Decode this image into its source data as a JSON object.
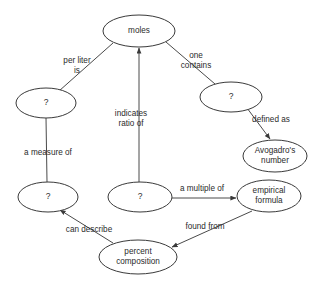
{
  "diagram": {
    "type": "concept-map",
    "background_color": "#ffffff",
    "stroke_color": "#3a3a3a",
    "text_color": "#2b2b2b",
    "nodes": [
      {
        "id": "moles",
        "label": "moles",
        "lines": [
          "moles"
        ],
        "cx": 139,
        "cy": 31,
        "rx": 36,
        "ry": 16
      },
      {
        "id": "q-molarity",
        "label": "?",
        "lines": [
          "?"
        ],
        "cx": 46,
        "cy": 103,
        "rx": 30,
        "ry": 15
      },
      {
        "id": "q-solution",
        "label": "?",
        "lines": [
          "?"
        ],
        "cx": 48,
        "cy": 197,
        "rx": 30,
        "ry": 15
      },
      {
        "id": "q-formula",
        "label": "?",
        "lines": [
          "?"
        ],
        "cx": 140,
        "cy": 197,
        "rx": 32,
        "ry": 15
      },
      {
        "id": "q-particles",
        "label": "?",
        "lines": [
          "?"
        ],
        "cx": 231,
        "cy": 97,
        "rx": 31,
        "ry": 15
      },
      {
        "id": "avogadro",
        "label": "Avogadro's number",
        "lines": [
          "Avogadro's",
          "number"
        ],
        "cx": 275,
        "cy": 156,
        "rx": 32,
        "ry": 16
      },
      {
        "id": "empirical",
        "label": "empirical formula",
        "lines": [
          "empirical",
          "formula"
        ],
        "cx": 269,
        "cy": 196,
        "rx": 32,
        "ry": 16
      },
      {
        "id": "percent",
        "label": "percent composition",
        "lines": [
          "percent",
          "composition"
        ],
        "cx": 138,
        "cy": 257,
        "rx": 39,
        "ry": 17
      }
    ],
    "edges": [
      {
        "id": "e-moles-molarity",
        "from": "moles",
        "to": "q-molarity",
        "label_lines": [
          "per liter",
          "is"
        ],
        "label_x": 77,
        "label_y": 66,
        "arrow": "none",
        "x1": 113,
        "y1": 43,
        "x2": 59,
        "y2": 91
      },
      {
        "id": "e-formula-moles",
        "from": "q-formula",
        "to": "moles",
        "label_lines": [
          "indicates",
          "ratio of"
        ],
        "label_x": 131,
        "label_y": 119,
        "arrow": "to",
        "x1": 139,
        "y1": 182,
        "x2": 139,
        "y2": 48
      },
      {
        "id": "e-moles-particles",
        "from": "moles",
        "to": "q-particles",
        "label_lines": [
          "one",
          "contains"
        ],
        "label_x": 196,
        "label_y": 61,
        "arrow": "none",
        "x1": 166,
        "y1": 42,
        "x2": 215,
        "y2": 84
      },
      {
        "id": "e-particles-avo",
        "from": "q-particles",
        "to": "avogadro",
        "label_lines": [
          "defined as"
        ],
        "label_x": 271,
        "label_y": 120,
        "arrow": "to",
        "x1": 247,
        "y1": 108,
        "x2": 270,
        "y2": 139
      },
      {
        "id": "e-molarity-soln",
        "from": "q-molarity",
        "to": "q-solution",
        "label_lines": [
          "a measure of"
        ],
        "label_x": 48,
        "label_y": 153,
        "arrow": "none",
        "x1": 46,
        "y1": 118,
        "x2": 47,
        "y2": 182
      },
      {
        "id": "e-formula-emp",
        "from": "q-formula",
        "to": "empirical",
        "label_lines": [
          "a multiple of"
        ],
        "label_x": 202,
        "label_y": 189,
        "arrow": "to",
        "x1": 172,
        "y1": 198,
        "x2": 236,
        "y2": 198
      },
      {
        "id": "e-percent-soln",
        "from": "percent",
        "to": "q-solution",
        "label_lines": [
          "can describe"
        ],
        "label_x": 89,
        "label_y": 230,
        "arrow": "to",
        "x1": 113,
        "y1": 243,
        "x2": 60,
        "y2": 210
      },
      {
        "id": "e-emp-percent",
        "from": "empirical",
        "to": "percent",
        "label_lines": [
          "found from"
        ],
        "label_x": 205,
        "label_y": 227,
        "arrow": "to",
        "x1": 252,
        "y1": 211,
        "x2": 172,
        "y2": 247
      }
    ]
  }
}
